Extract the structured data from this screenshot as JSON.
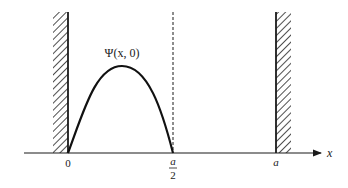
{
  "diagram": {
    "type": "infinite-square-well-wavefunction",
    "curve_label": "Ψ(x, 0)",
    "axis": {
      "label": "x",
      "ticks": [
        {
          "id": "origin",
          "text": "0"
        },
        {
          "id": "half",
          "numerator": "a",
          "denominator": "2"
        },
        {
          "id": "width",
          "text": "a"
        }
      ]
    },
    "walls": [
      {
        "id": "left-wall",
        "position": "0"
      },
      {
        "id": "right-wall",
        "position": "a"
      }
    ],
    "dashed_line": {
      "position": "a/2"
    },
    "colors": {
      "ink": "#1a1a1a",
      "background": "#ffffff"
    }
  }
}
